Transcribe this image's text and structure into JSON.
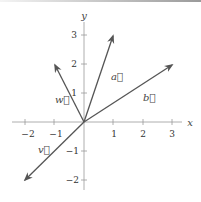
{
  "diagram": {
    "type": "vector-plot",
    "axes": {
      "x_label": "x",
      "y_label": "y",
      "x_ticks": [
        "−2",
        "−1",
        "1",
        "2",
        "3"
      ],
      "y_ticks": [
        "3",
        "2",
        "1",
        "−1",
        "−2"
      ],
      "x_range": [
        -2,
        3
      ],
      "y_range": [
        -2,
        3
      ]
    },
    "vectors": [
      {
        "name": "a",
        "label": "a⃗",
        "components": [
          1,
          3
        ]
      },
      {
        "name": "b",
        "label": "b⃗",
        "components": [
          3,
          2
        ]
      },
      {
        "name": "w",
        "label": "w⃗",
        "components": [
          -1,
          2
        ]
      },
      {
        "name": "v",
        "label": "v⃗",
        "components": [
          -2,
          -2
        ]
      }
    ],
    "colors": {
      "axis": "#888888",
      "vector": "#555555",
      "text": "#444444"
    }
  }
}
